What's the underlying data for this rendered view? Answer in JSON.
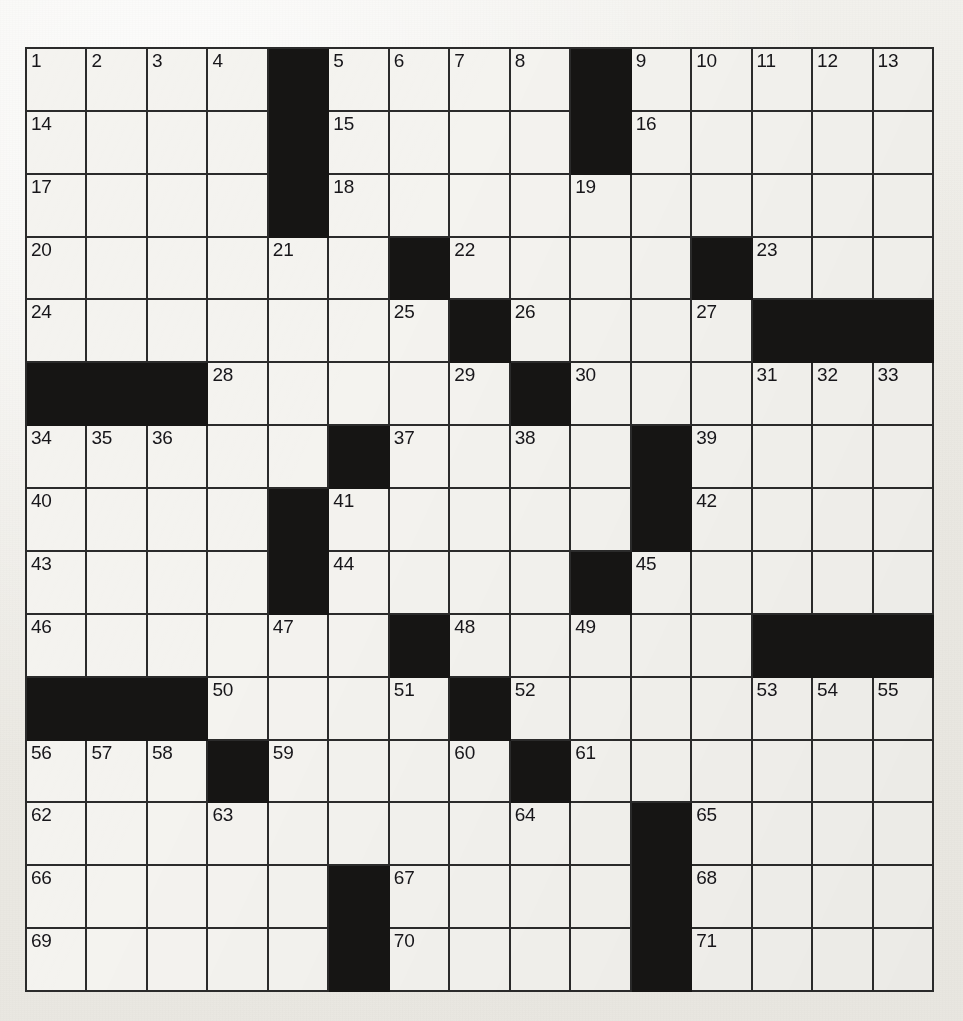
{
  "puzzle": {
    "type": "crossword-grid",
    "title": "",
    "rows": 15,
    "columns": 15,
    "colors": {
      "block": "#161514",
      "cell": "#f4f3ef",
      "grid_line": "#2b2b2b",
      "number_text": "#17161a",
      "page_background": "#efeeea"
    },
    "highest_clue_number": 71,
    "grid": [
      [
        {
          "type": "open",
          "number": "1"
        },
        {
          "type": "open",
          "number": "2"
        },
        {
          "type": "open",
          "number": "3"
        },
        {
          "type": "open",
          "number": "4"
        },
        {
          "type": "block",
          "number": ""
        },
        {
          "type": "open",
          "number": "5"
        },
        {
          "type": "open",
          "number": "6"
        },
        {
          "type": "open",
          "number": "7"
        },
        {
          "type": "open",
          "number": "8"
        },
        {
          "type": "block",
          "number": ""
        },
        {
          "type": "open",
          "number": "9"
        },
        {
          "type": "open",
          "number": "10"
        },
        {
          "type": "open",
          "number": "11"
        },
        {
          "type": "open",
          "number": "12"
        },
        {
          "type": "open",
          "number": "13"
        }
      ],
      [
        {
          "type": "open",
          "number": "14"
        },
        {
          "type": "open",
          "number": ""
        },
        {
          "type": "open",
          "number": ""
        },
        {
          "type": "open",
          "number": ""
        },
        {
          "type": "block",
          "number": ""
        },
        {
          "type": "open",
          "number": "15"
        },
        {
          "type": "open",
          "number": ""
        },
        {
          "type": "open",
          "number": ""
        },
        {
          "type": "open",
          "number": ""
        },
        {
          "type": "block",
          "number": ""
        },
        {
          "type": "open",
          "number": "16"
        },
        {
          "type": "open",
          "number": ""
        },
        {
          "type": "open",
          "number": ""
        },
        {
          "type": "open",
          "number": ""
        },
        {
          "type": "open",
          "number": ""
        }
      ],
      [
        {
          "type": "open",
          "number": "17"
        },
        {
          "type": "open",
          "number": ""
        },
        {
          "type": "open",
          "number": ""
        },
        {
          "type": "open",
          "number": ""
        },
        {
          "type": "block",
          "number": ""
        },
        {
          "type": "open",
          "number": "18"
        },
        {
          "type": "open",
          "number": ""
        },
        {
          "type": "open",
          "number": ""
        },
        {
          "type": "open",
          "number": ""
        },
        {
          "type": "open",
          "number": "19"
        },
        {
          "type": "open",
          "number": ""
        },
        {
          "type": "open",
          "number": ""
        },
        {
          "type": "open",
          "number": ""
        },
        {
          "type": "open",
          "number": ""
        },
        {
          "type": "open",
          "number": ""
        }
      ],
      [
        {
          "type": "open",
          "number": "20"
        },
        {
          "type": "open",
          "number": ""
        },
        {
          "type": "open",
          "number": ""
        },
        {
          "type": "open",
          "number": ""
        },
        {
          "type": "open",
          "number": "21"
        },
        {
          "type": "open",
          "number": ""
        },
        {
          "type": "block",
          "number": ""
        },
        {
          "type": "open",
          "number": "22"
        },
        {
          "type": "open",
          "number": ""
        },
        {
          "type": "open",
          "number": ""
        },
        {
          "type": "open",
          "number": ""
        },
        {
          "type": "block",
          "number": ""
        },
        {
          "type": "open",
          "number": "23"
        },
        {
          "type": "open",
          "number": ""
        },
        {
          "type": "open",
          "number": ""
        }
      ],
      [
        {
          "type": "open",
          "number": "24"
        },
        {
          "type": "open",
          "number": ""
        },
        {
          "type": "open",
          "number": ""
        },
        {
          "type": "open",
          "number": ""
        },
        {
          "type": "open",
          "number": ""
        },
        {
          "type": "open",
          "number": ""
        },
        {
          "type": "open",
          "number": "25"
        },
        {
          "type": "block",
          "number": ""
        },
        {
          "type": "open",
          "number": "26"
        },
        {
          "type": "open",
          "number": ""
        },
        {
          "type": "open",
          "number": ""
        },
        {
          "type": "open",
          "number": "27"
        },
        {
          "type": "block",
          "number": ""
        },
        {
          "type": "block",
          "number": ""
        },
        {
          "type": "block",
          "number": ""
        }
      ],
      [
        {
          "type": "block",
          "number": ""
        },
        {
          "type": "block",
          "number": ""
        },
        {
          "type": "block",
          "number": ""
        },
        {
          "type": "open",
          "number": "28"
        },
        {
          "type": "open",
          "number": ""
        },
        {
          "type": "open",
          "number": ""
        },
        {
          "type": "open",
          "number": ""
        },
        {
          "type": "open",
          "number": "29"
        },
        {
          "type": "block",
          "number": ""
        },
        {
          "type": "open",
          "number": "30"
        },
        {
          "type": "open",
          "number": ""
        },
        {
          "type": "open",
          "number": ""
        },
        {
          "type": "open",
          "number": "31"
        },
        {
          "type": "open",
          "number": "32"
        },
        {
          "type": "open",
          "number": "33"
        }
      ],
      [
        {
          "type": "open",
          "number": "34"
        },
        {
          "type": "open",
          "number": "35"
        },
        {
          "type": "open",
          "number": "36"
        },
        {
          "type": "open",
          "number": ""
        },
        {
          "type": "open",
          "number": ""
        },
        {
          "type": "block",
          "number": ""
        },
        {
          "type": "open",
          "number": "37"
        },
        {
          "type": "open",
          "number": ""
        },
        {
          "type": "open",
          "number": "38"
        },
        {
          "type": "open",
          "number": ""
        },
        {
          "type": "block",
          "number": ""
        },
        {
          "type": "open",
          "number": "39"
        },
        {
          "type": "open",
          "number": ""
        },
        {
          "type": "open",
          "number": ""
        },
        {
          "type": "open",
          "number": ""
        }
      ],
      [
        {
          "type": "open",
          "number": "40"
        },
        {
          "type": "open",
          "number": ""
        },
        {
          "type": "open",
          "number": ""
        },
        {
          "type": "open",
          "number": ""
        },
        {
          "type": "block",
          "number": ""
        },
        {
          "type": "open",
          "number": "41"
        },
        {
          "type": "open",
          "number": ""
        },
        {
          "type": "open",
          "number": ""
        },
        {
          "type": "open",
          "number": ""
        },
        {
          "type": "open",
          "number": ""
        },
        {
          "type": "block",
          "number": ""
        },
        {
          "type": "open",
          "number": "42"
        },
        {
          "type": "open",
          "number": ""
        },
        {
          "type": "open",
          "number": ""
        },
        {
          "type": "open",
          "number": ""
        }
      ],
      [
        {
          "type": "open",
          "number": "43"
        },
        {
          "type": "open",
          "number": ""
        },
        {
          "type": "open",
          "number": ""
        },
        {
          "type": "open",
          "number": ""
        },
        {
          "type": "block",
          "number": ""
        },
        {
          "type": "open",
          "number": "44"
        },
        {
          "type": "open",
          "number": ""
        },
        {
          "type": "open",
          "number": ""
        },
        {
          "type": "open",
          "number": ""
        },
        {
          "type": "block",
          "number": ""
        },
        {
          "type": "open",
          "number": "45"
        },
        {
          "type": "open",
          "number": ""
        },
        {
          "type": "open",
          "number": ""
        },
        {
          "type": "open",
          "number": ""
        },
        {
          "type": "open",
          "number": ""
        }
      ],
      [
        {
          "type": "open",
          "number": "46"
        },
        {
          "type": "open",
          "number": ""
        },
        {
          "type": "open",
          "number": ""
        },
        {
          "type": "open",
          "number": ""
        },
        {
          "type": "open",
          "number": "47"
        },
        {
          "type": "open",
          "number": ""
        },
        {
          "type": "block",
          "number": ""
        },
        {
          "type": "open",
          "number": "48"
        },
        {
          "type": "open",
          "number": ""
        },
        {
          "type": "open",
          "number": "49"
        },
        {
          "type": "open",
          "number": ""
        },
        {
          "type": "open",
          "number": ""
        },
        {
          "type": "block",
          "number": ""
        },
        {
          "type": "block",
          "number": ""
        },
        {
          "type": "block",
          "number": ""
        }
      ],
      [
        {
          "type": "block",
          "number": ""
        },
        {
          "type": "block",
          "number": ""
        },
        {
          "type": "block",
          "number": ""
        },
        {
          "type": "open",
          "number": "50"
        },
        {
          "type": "open",
          "number": ""
        },
        {
          "type": "open",
          "number": ""
        },
        {
          "type": "open",
          "number": "51"
        },
        {
          "type": "block",
          "number": ""
        },
        {
          "type": "open",
          "number": "52"
        },
        {
          "type": "open",
          "number": ""
        },
        {
          "type": "open",
          "number": ""
        },
        {
          "type": "open",
          "number": ""
        },
        {
          "type": "open",
          "number": "53"
        },
        {
          "type": "open",
          "number": "54"
        },
        {
          "type": "open",
          "number": "55"
        }
      ],
      [
        {
          "type": "open",
          "number": "56"
        },
        {
          "type": "open",
          "number": "57"
        },
        {
          "type": "open",
          "number": "58"
        },
        {
          "type": "block",
          "number": ""
        },
        {
          "type": "open",
          "number": "59"
        },
        {
          "type": "open",
          "number": ""
        },
        {
          "type": "open",
          "number": ""
        },
        {
          "type": "open",
          "number": "60"
        },
        {
          "type": "block",
          "number": ""
        },
        {
          "type": "open",
          "number": "61"
        },
        {
          "type": "open",
          "number": ""
        },
        {
          "type": "open",
          "number": ""
        },
        {
          "type": "open",
          "number": ""
        },
        {
          "type": "open",
          "number": ""
        },
        {
          "type": "open",
          "number": ""
        }
      ],
      [
        {
          "type": "open",
          "number": "62"
        },
        {
          "type": "open",
          "number": ""
        },
        {
          "type": "open",
          "number": ""
        },
        {
          "type": "open",
          "number": "63"
        },
        {
          "type": "open",
          "number": ""
        },
        {
          "type": "open",
          "number": ""
        },
        {
          "type": "open",
          "number": ""
        },
        {
          "type": "open",
          "number": ""
        },
        {
          "type": "open",
          "number": "64"
        },
        {
          "type": "open",
          "number": ""
        },
        {
          "type": "block",
          "number": ""
        },
        {
          "type": "open",
          "number": "65"
        },
        {
          "type": "open",
          "number": ""
        },
        {
          "type": "open",
          "number": ""
        },
        {
          "type": "open",
          "number": ""
        }
      ],
      [
        {
          "type": "open",
          "number": "66"
        },
        {
          "type": "open",
          "number": ""
        },
        {
          "type": "open",
          "number": ""
        },
        {
          "type": "open",
          "number": ""
        },
        {
          "type": "open",
          "number": ""
        },
        {
          "type": "block",
          "number": ""
        },
        {
          "type": "open",
          "number": "67"
        },
        {
          "type": "open",
          "number": ""
        },
        {
          "type": "open",
          "number": ""
        },
        {
          "type": "open",
          "number": ""
        },
        {
          "type": "block",
          "number": ""
        },
        {
          "type": "open",
          "number": "68"
        },
        {
          "type": "open",
          "number": ""
        },
        {
          "type": "open",
          "number": ""
        },
        {
          "type": "open",
          "number": ""
        }
      ],
      [
        {
          "type": "open",
          "number": "69"
        },
        {
          "type": "open",
          "number": ""
        },
        {
          "type": "open",
          "number": ""
        },
        {
          "type": "open",
          "number": ""
        },
        {
          "type": "open",
          "number": ""
        },
        {
          "type": "block",
          "number": ""
        },
        {
          "type": "open",
          "number": "70"
        },
        {
          "type": "open",
          "number": ""
        },
        {
          "type": "open",
          "number": ""
        },
        {
          "type": "open",
          "number": ""
        },
        {
          "type": "block",
          "number": ""
        },
        {
          "type": "open",
          "number": "71"
        },
        {
          "type": "open",
          "number": ""
        },
        {
          "type": "open",
          "number": ""
        },
        {
          "type": "open",
          "number": ""
        }
      ]
    ]
  }
}
